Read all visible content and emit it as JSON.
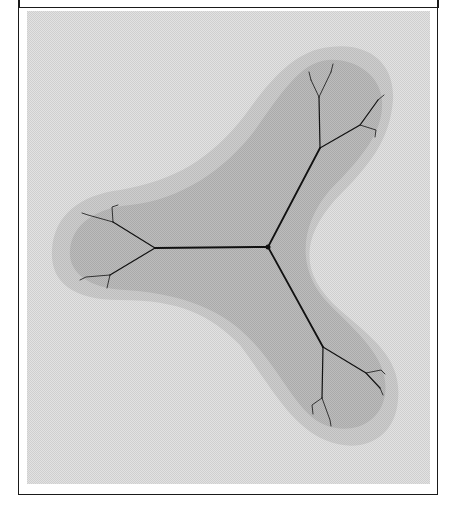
{
  "figure": {
    "caption_cut": "",
    "colors": {
      "background": "#d9d9d9",
      "halo": "#c8c8c8",
      "body": "#b6b6b6",
      "filament": "#111111",
      "frame": "#1a1a1a"
    },
    "center": [
      268,
      247
    ],
    "junctions": {
      "upper": [
        320,
        148
      ],
      "left": [
        155,
        248
      ],
      "lower": [
        323,
        347
      ]
    }
  }
}
